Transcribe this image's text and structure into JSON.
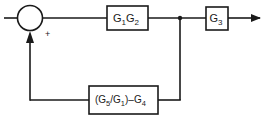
{
  "diagram": {
    "type": "block-diagram",
    "stroke_color": "#1a1a1a",
    "background": "#ffffff",
    "summing_junction": {
      "sign_label": "+"
    },
    "blocks": {
      "forward": {
        "main": "G",
        "sub1": "1",
        "main2": "G",
        "sub2": "2"
      },
      "output": {
        "main": "G",
        "sub": "3"
      },
      "feedback": {
        "open": "(G",
        "sub5": "5",
        "slash": "/G",
        "sub1": "1",
        "close": ")–G",
        "sub4": "4"
      }
    }
  }
}
